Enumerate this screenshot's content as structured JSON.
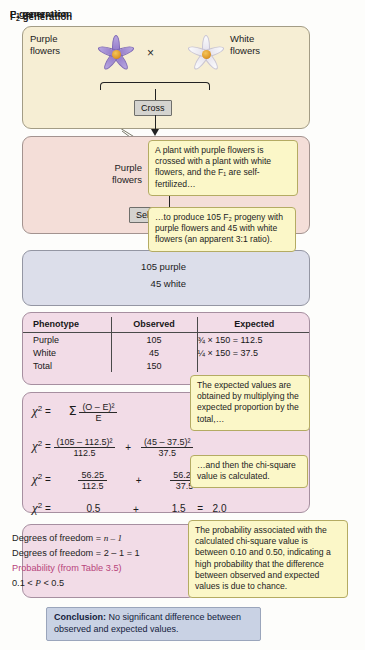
{
  "p_generation": {
    "title": "P generation",
    "title_sub": "",
    "purple_label_line1": "Purple",
    "purple_label_line2": "flowers",
    "white_label_line1": "White",
    "white_label_line2": "flowers",
    "cross_symbol": "×",
    "flow_label": "Cross",
    "purple_flower_icon": "purple-flower-icon",
    "white_flower_icon": "white-flower-icon"
  },
  "f1_generation": {
    "title_main": "F",
    "title_sub": "1",
    "title_rest": " generation",
    "purple_label_line1": "Purple",
    "purple_label_line2": "flowers",
    "flow_label": "Self-fertilize",
    "flower_icon": "purple-flower-icon"
  },
  "f2_generation": {
    "title_main": "F",
    "title_sub": "2",
    "title_rest": " generation",
    "purple_count": "105 purple",
    "white_count": "45 white"
  },
  "table": {
    "headers": [
      "Phenotype",
      "Observed",
      "Expected"
    ],
    "rows": [
      {
        "phenotype": "Purple",
        "observed": "105",
        "expected": "¾ × 150 = 112.5"
      },
      {
        "phenotype": "White",
        "observed": "45",
        "expected": "¼ × 150 =  37.5"
      },
      {
        "phenotype": "Total",
        "observed": "150",
        "expected": ""
      }
    ]
  },
  "chi_square": {
    "symbol": "χ",
    "exponent": "2",
    "equals": "=",
    "line1": {
      "sigma": "Σ",
      "numerator": "(O – E)²",
      "denominator": "E"
    },
    "line2": {
      "term1_num": "(105 – 112.5)²",
      "term1_den": "112.5",
      "operator": "+",
      "term2_num": "(45 – 37.5)²",
      "term2_den": "37.5"
    },
    "line3": {
      "term1_num": "56.25",
      "term1_den": "112.5",
      "operator": "+",
      "term2_num": "56.25",
      "term2_den": "37.5"
    },
    "line4": {
      "term1": "0.5",
      "operator": "+",
      "term2": "1.5",
      "equals": "=",
      "result": "2.0"
    }
  },
  "degrees_of_freedom": {
    "line1_label": "Degrees of freedom = ",
    "line1_value": "n – 1",
    "line2": "Degrees of freedom = 2 – 1 = 1",
    "line3": "Probability (from Table 3.5)",
    "line4_a": "0.1 < ",
    "line4_b": "P",
    "line4_c": " < 0.5"
  },
  "conclusion": {
    "label": "Conclusion:",
    "text": " No significant difference between observed and expected values."
  },
  "callouts": {
    "c1": "A plant with purple flowers is crossed with a plant with white flowers, and the F₁ are self-fertilized…",
    "c2": "…to produce 105 F₂ progeny with purple flowers and 45 with white flowers (an apparent 3:1 ratio).",
    "c3": "The expected values are obtained by multiplying the expected proportion by the total,…",
    "c4": "…and then the chi-square value is calculated.",
    "c5": "The probability associated with the calculated chi-square value is between 0.10 and 0.50, indicating a high probability that the difference between observed and expected values is due to chance."
  },
  "colors": {
    "p_generation_bg": "#f6eed4",
    "f1_generation_bg": "#f4ded8",
    "f2_generation_bg": "#dcdeea",
    "table_bg": "#f2dce7",
    "callout_bg": "#fbf7c8",
    "conclusion_bg": "#c9d2e4",
    "purple_flower": "#9e87d0",
    "white_flower": "#eceaf2",
    "flower_center": "#e09a2a",
    "pink_text": "#b8447c"
  }
}
